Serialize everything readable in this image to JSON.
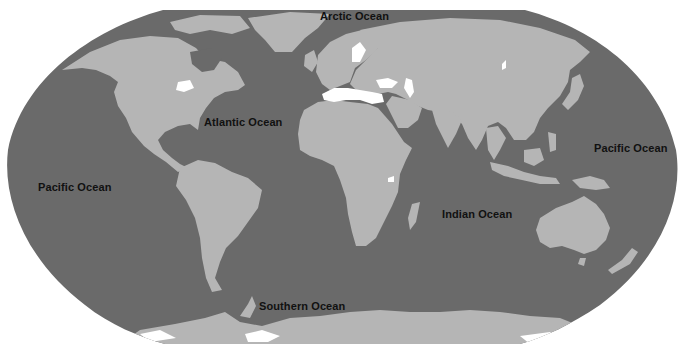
{
  "map": {
    "projection": "world-map-robinson-style",
    "colors": {
      "ocean": "#6a6a6a",
      "land": "#b5b5b5",
      "water_bodies": "#ffffff",
      "background": "#ffffff",
      "label": "#111111"
    },
    "labels": [
      {
        "id": "arctic",
        "text": "Arctic Ocean",
        "x": 320,
        "y": 17
      },
      {
        "id": "atlantic",
        "text": "Atlantic Ocean",
        "x": 204,
        "y": 122
      },
      {
        "id": "pacific-west",
        "text": "Pacific Ocean",
        "x": 38,
        "y": 187
      },
      {
        "id": "pacific-east",
        "text": "Pacific Ocean",
        "x": 594,
        "y": 148
      },
      {
        "id": "indian",
        "text": "Indian Ocean",
        "x": 442,
        "y": 214
      },
      {
        "id": "southern",
        "text": "Southern Ocean",
        "x": 259,
        "y": 306
      }
    ]
  }
}
